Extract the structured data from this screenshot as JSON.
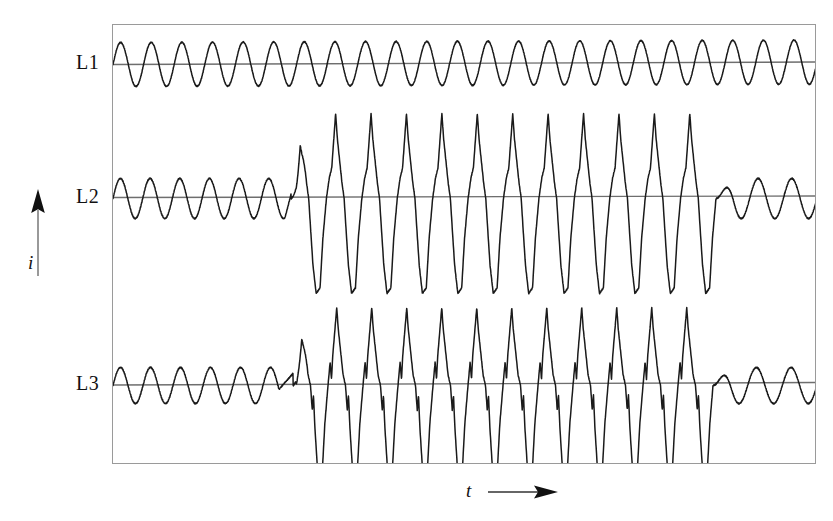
{
  "figure": {
    "type": "oscillogram",
    "background_color": "#ffffff",
    "trace_color": "#1a1a1a",
    "baseline_color": "#6e6e6e",
    "frame_color": "#9a9a9a"
  },
  "axes": {
    "y": {
      "label": "i",
      "arrow": "up-arrow-icon",
      "meaning": "current"
    },
    "x": {
      "label": "t",
      "arrow": "right-arrow-icon",
      "meaning": "time"
    }
  },
  "channels": [
    {
      "id": "L1",
      "label": "L1"
    },
    {
      "id": "L2",
      "label": "L2"
    },
    {
      "id": "L3",
      "label": "L3"
    }
  ],
  "chart_data": {
    "type": "line",
    "title": "",
    "subtitle": "",
    "xlabel": "t",
    "ylabel": "i",
    "grid": false,
    "legend": "none",
    "xlim": [
      0,
      704
    ],
    "ylim": [
      -1.0,
      1.0
    ],
    "x_axis_ticks": [],
    "y_axis_ticks": [],
    "annotations": [
      {
        "text": "L1",
        "position": "left-of-trace-1"
      },
      {
        "text": "L2",
        "position": "left-of-trace-2"
      },
      {
        "text": "L3",
        "position": "left-of-trace-3"
      },
      {
        "text": "i",
        "position": "left-axis-arrow-up"
      },
      {
        "text": "t",
        "position": "bottom-axis-arrow-right"
      }
    ],
    "series": [
      {
        "name": "L1",
        "baseline_y": 38,
        "description": "Undisturbed sinusoidal phase current, constant amplitude across the whole record.",
        "waveform": "sine",
        "cycles": 23,
        "amplitude": 22,
        "burst": null,
        "values": [
          0,
          0.95,
          0.2,
          -0.95,
          -0.2,
          0.95,
          0.25,
          -0.95,
          -0.2,
          0.95,
          0.2,
          -0.95,
          -0.25,
          0.95,
          0.2,
          -0.95,
          -0.2,
          0.95,
          0.25,
          -0.95,
          -0.2,
          0.95,
          0.2,
          -0.95
        ]
      },
      {
        "name": "L2",
        "baseline_y": 172,
        "description": "Sinusoidal current, then a high-amplitude peaked distorted burst, then recovery to sinusoid.",
        "waveform": "sine-burst-sine",
        "pre_burst_cycles": 6,
        "pre_burst_amplitude": 20,
        "burst": {
          "start_x": 178,
          "end_x": 603,
          "cycles": 12,
          "peak_positive": 85,
          "peak_negative": 95,
          "shape": "peaked-with-shoulder"
        },
        "post_burst_cycles": 3,
        "post_burst_amplitude": 20
      },
      {
        "name": "L3",
        "baseline_y": 359,
        "description": "Sinusoidal current, then a high-amplitude distorted burst with commutation notches on both flanks, then recovery to sinusoid.",
        "waveform": "sine-burst-sine",
        "pre_burst_cycles": 6,
        "pre_burst_amplitude": 18,
        "burst": {
          "start_x": 180,
          "end_x": 600,
          "cycles": 12,
          "peak_positive": 78,
          "peak_negative": 95,
          "shape": "notched-peaked"
        },
        "post_burst_cycles": 3,
        "post_burst_amplitude": 18
      }
    ]
  }
}
